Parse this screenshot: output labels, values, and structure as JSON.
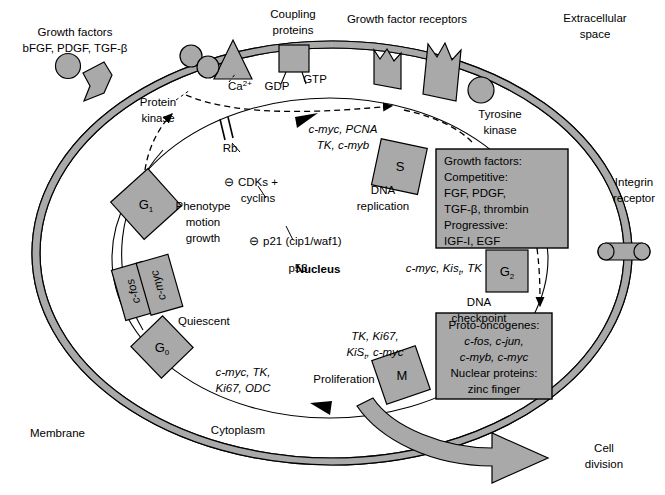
{
  "diagram": {
    "title_semantic": "cell-cycle-signal-transduction-diagram",
    "colors": {
      "shape_fill": "#a9a9a9",
      "shape_stroke": "#000000",
      "membrane_fill": "#a9a9a9",
      "background": "#ffffff",
      "text": "#000000"
    },
    "outside_labels": {
      "extracellular_space_line1": "Extracellular",
      "extracellular_space_line2": "space",
      "growth_factors_line1": "Growth factors",
      "growth_factors_line2": "bFGF, PDGF, TGF-β",
      "coupling_proteins_line1": "Coupling",
      "coupling_proteins_line2": "proteins",
      "growth_factor_receptors": "Growth factor receptors",
      "integrin_receptor_line1": "Integrin",
      "integrin_receptor_line2": "receptor",
      "membrane": "Membrane",
      "cell_division_line1": "Cell",
      "cell_division_line2": "division"
    },
    "membrane_labels": {
      "ca2_base": "Ca",
      "ca2_sup": "2+",
      "gdp": "GDP",
      "gtp": "GTP",
      "protein_kinase_line1": "Protein",
      "protein_kinase_line2": "kinase",
      "tyrosine_kinase_line1": "Tyrosine",
      "tyrosine_kinase_line2": "kinase"
    },
    "cytoplasm_labels": {
      "cytoplasm": "Cytoplasm",
      "nucleus": "Nucleus",
      "proliferation": "Proliferation",
      "quiescent": "Quiescent",
      "phenotype_line1": "Phenotype",
      "phenotype_line2": "motion",
      "phenotype_line3": "growth",
      "dna_replication_line1": "DNA",
      "dna_replication_line2": "replication",
      "dna_checkpoint_line1": "DNA",
      "dna_checkpoint_line2": "checkpoint"
    },
    "regulators": {
      "rb": "Rb",
      "cdks_line1": "CDKs +",
      "cdks_line2": "cyclins",
      "p21": "p21 (cip1/waf1)",
      "p53": "p53",
      "inhibit_symbol": "⊖"
    },
    "phase_boxes": [
      {
        "id": "g1",
        "label": "G",
        "sub": "1"
      },
      {
        "id": "g0",
        "label": "G",
        "sub": "0"
      },
      {
        "id": "s",
        "label": "S",
        "sub": ""
      },
      {
        "id": "g2",
        "label": "G",
        "sub": "2"
      },
      {
        "id": "m",
        "label": "M",
        "sub": ""
      },
      {
        "id": "cfos",
        "label": "c-fos",
        "sub": ""
      },
      {
        "id": "cmyc",
        "label": "c-myc",
        "sub": ""
      }
    ],
    "gene_annotations": {
      "g1_to_s_line1": "c-myc, PCNA",
      "g1_to_s_line2": "TK, c-myb",
      "g2_genes": "c-myc, Kis",
      "g2_genes_sub": "t",
      "g2_genes_tail": ", TK",
      "m_genes_line1": "TK, Ki67,",
      "m_genes_line2_a": "KiS",
      "m_genes_line2_sub": "t",
      "m_genes_line2_b": ", c-myc",
      "g0_genes_line1": "c-myc, TK,",
      "g0_genes_line2": "Ki67, ODC"
    },
    "growth_factors_box": {
      "lines": [
        "Growth factors:",
        "Competitive:",
        "FGF, PDGF,",
        "TGF-β, thrombin",
        "Progressive:",
        "IGF-I, EGF"
      ]
    },
    "proto_oncogenes_box": {
      "lines": [
        "Proto-oncogenes:",
        "c-fos, c-jun,",
        "c-myb, c-myc",
        "Nuclear proteins:",
        "zinc finger"
      ],
      "italic_line_indices": [
        1,
        2
      ]
    }
  }
}
